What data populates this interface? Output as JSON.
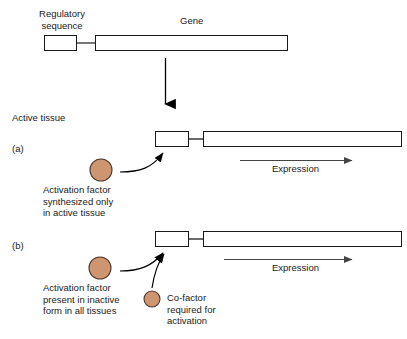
{
  "figure": {
    "type": "biology-diagram",
    "title_top": {
      "regulatory_label": "Regulatory\nsequence",
      "gene_label": "Gene"
    },
    "section_header": "Active tissue",
    "panels": [
      {
        "letter": "(a)",
        "expression_label": "Expression",
        "factor_caption": "Activation factor\nsynthesized only\nin active tissue",
        "cofactor_caption": null
      },
      {
        "letter": "(b)",
        "expression_label": "Expression",
        "factor_caption": "Activation factor\npresent in inactive\nform in all tissues",
        "cofactor_caption": "Co-factor\nrequired for\nactivation"
      }
    ]
  },
  "colors": {
    "circle_fill": "#cd9670",
    "circle_stroke": "#4a3a2e",
    "box_stroke": "#1a1a1a",
    "box_fill": "#ffffff",
    "arrow_black": "#000000",
    "arrow_gray": "#555555",
    "background": "#ffffff",
    "text": "#1a1a1a"
  }
}
